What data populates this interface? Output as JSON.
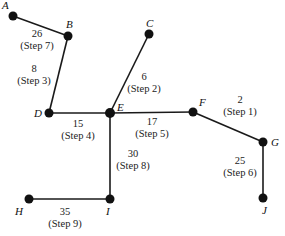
{
  "diagram": {
    "type": "minimum-spanning-tree",
    "nodes": [
      {
        "id": "A",
        "label": "A",
        "x": 13,
        "y": 16
      },
      {
        "id": "B",
        "label": "B",
        "x": 68,
        "y": 36
      },
      {
        "id": "C",
        "label": "C",
        "x": 149,
        "y": 34
      },
      {
        "id": "D",
        "label": "D",
        "x": 49,
        "y": 113
      },
      {
        "id": "E",
        "label": "E",
        "x": 110,
        "y": 113
      },
      {
        "id": "F",
        "label": "F",
        "x": 193,
        "y": 112
      },
      {
        "id": "G",
        "label": "G",
        "x": 263,
        "y": 142
      },
      {
        "id": "J",
        "label": "J",
        "x": 263,
        "y": 198
      },
      {
        "id": "H",
        "label": "H",
        "x": 29,
        "y": 199
      },
      {
        "id": "I",
        "label": "I",
        "x": 110,
        "y": 199
      }
    ],
    "edges": [
      {
        "from": "F",
        "to": "G",
        "weight": "2",
        "step": "(Step 1)"
      },
      {
        "from": "E",
        "to": "C",
        "weight": "6",
        "step": "(Step 2)"
      },
      {
        "from": "B",
        "to": "D",
        "weight": "8",
        "step": "(Step 3)"
      },
      {
        "from": "D",
        "to": "E",
        "weight": "15",
        "step": "(Step 4)"
      },
      {
        "from": "E",
        "to": "F",
        "weight": "17",
        "step": "(Step 5)"
      },
      {
        "from": "G",
        "to": "J",
        "weight": "25",
        "step": "(Step 6)"
      },
      {
        "from": "A",
        "to": "B",
        "weight": "26",
        "step": "(Step 7)"
      },
      {
        "from": "E",
        "to": "I",
        "weight": "30",
        "step": "(Step 8)"
      },
      {
        "from": "H",
        "to": "I",
        "weight": "35",
        "step": "(Step 9)"
      }
    ]
  }
}
